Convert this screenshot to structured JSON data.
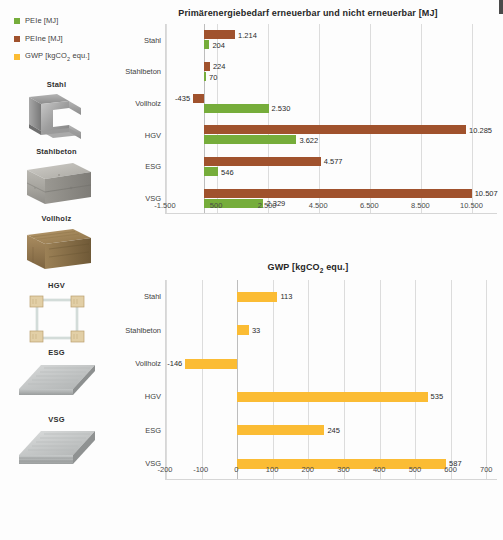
{
  "legend": {
    "items": [
      {
        "label": "PEIe [MJ]",
        "color": "#76AD3B",
        "icon": "legend-swatch-green"
      },
      {
        "label": "PEIne [MJ]",
        "color": "#A0522D",
        "icon": "legend-swatch-brown"
      },
      {
        "label": "GWP [kgCO2 equ.]",
        "label_main": "GWP [kgCO",
        "label_sub": "2",
        "label_tail": " equ.]",
        "color": "#FBBC34",
        "icon": "legend-swatch-yellow"
      }
    ]
  },
  "samples": [
    {
      "caption": "Stahl",
      "art": "steel-profile-photo"
    },
    {
      "caption": "Stahlbeton",
      "art": "reinforced-concrete-block-photo"
    },
    {
      "caption": "Vollholz",
      "art": "solid-timber-block-photo"
    },
    {
      "caption": "HGV",
      "art": "timber-glass-composite-frame-photo"
    },
    {
      "caption": "ESG",
      "art": "toughened-glass-pane-photo"
    },
    {
      "caption": "VSG",
      "art": "laminated-safety-glass-pane-photo"
    }
  ],
  "colors": {
    "green": "#76AD3B",
    "brown": "#A0522D",
    "yellow": "#FBBC34",
    "grid": "#dcdcdc",
    "text": "#3a3a3a"
  },
  "chart_data": [
    {
      "id": "pe",
      "type": "bar",
      "orientation": "horizontal",
      "title": "Primärenergiebedarf erneuerbar und nicht erneuerbar [MJ]",
      "title_main": "Primärenergiebedarf erneuerbar und nicht erneuerbar [MJ]",
      "xlabel": "",
      "ylabel": "",
      "categories": [
        "Stahl",
        "Stahlbeton",
        "Vollholz",
        "HGV",
        "ESG",
        "VSG"
      ],
      "series": [
        {
          "name": "PEIne [MJ]",
          "color": "#A0522D",
          "values": [
            1214,
            224,
            -435,
            10285,
            4577,
            10507
          ],
          "labels": [
            "1.214",
            "224",
            "-435",
            "10.285",
            "4.577",
            "10.507"
          ]
        },
        {
          "name": "PEIe [MJ]",
          "color": "#76AD3B",
          "values": [
            204,
            70,
            2530,
            3622,
            546,
            2329
          ],
          "labels": [
            "204",
            "70",
            "2.530",
            "3.622",
            "546",
            "2.329"
          ]
        }
      ],
      "xlim": [
        -1500,
        11500
      ],
      "xticks": [
        -1500,
        500,
        2500,
        4500,
        6500,
        8500,
        10500
      ],
      "xticklabels": [
        "-1.500",
        "500",
        "2.500",
        "4.500",
        "6.500",
        "8.500",
        "10.500"
      ],
      "grid": true,
      "legend_position": "outside-top-left"
    },
    {
      "id": "gwp",
      "type": "bar",
      "orientation": "horizontal",
      "title": "GWP [kgCO2 equ.]",
      "title_main": "GWP [kgCO",
      "title_sub": "2",
      "title_tail": " equ.]",
      "xlabel": "",
      "ylabel": "",
      "categories": [
        "Stahl",
        "Stahlbeton",
        "Vollholz",
        "HGV",
        "ESG",
        "VSG"
      ],
      "series": [
        {
          "name": "GWP [kgCO2 equ.]",
          "color": "#FBBC34",
          "values": [
            113,
            33,
            -146,
            535,
            245,
            587
          ],
          "labels": [
            "113",
            "33",
            "-146",
            "535",
            "245",
            "587"
          ]
        }
      ],
      "xlim": [
        -200,
        730
      ],
      "xticks": [
        -200,
        -100,
        0,
        100,
        200,
        300,
        400,
        500,
        600,
        700
      ],
      "xticklabels": [
        "-200",
        "-100",
        "0",
        "100",
        "200",
        "300",
        "400",
        "500",
        "600",
        "700"
      ],
      "grid": true,
      "legend_position": "none"
    }
  ]
}
